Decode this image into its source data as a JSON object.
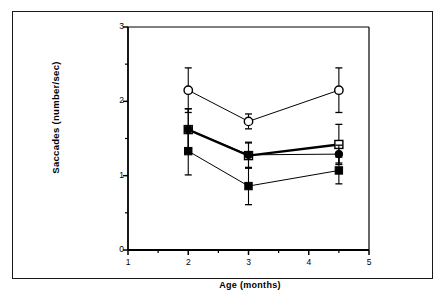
{
  "figure": {
    "background_color": "#ffffff",
    "frame_color": "#1a1a1a",
    "line_color": "#000000"
  },
  "axes": {
    "x_label": "Age (months)",
    "y_label": "Saccades   (number/sec)",
    "x_ticks": [
      "1",
      "2",
      "3",
      "4",
      "5"
    ],
    "y_ticks": [
      "0",
      "1",
      "2",
      "3"
    ]
  },
  "chart_data": {
    "type": "line",
    "title": "",
    "xlabel": "Age (months)",
    "ylabel": "Saccades (number/sec)",
    "xlim": [
      1,
      5
    ],
    "ylim": [
      0,
      3
    ],
    "x_ticks": [
      1,
      2,
      3,
      4,
      5
    ],
    "y_ticks": [
      0,
      1,
      2,
      3
    ],
    "x_minor_ticks": [
      1.5,
      2.5,
      3.5,
      4.5
    ],
    "y_minor_ticks": [
      0.5,
      1.5,
      2.5
    ],
    "grid": false,
    "legend": "none",
    "error_bars": "symmetric",
    "x": [
      2,
      3,
      4.5
    ],
    "series": [
      {
        "name": "open-circle",
        "marker": "open-circle",
        "line_width": 1,
        "values": [
          2.15,
          1.73,
          2.15
        ],
        "errors": [
          0.3,
          0.1,
          0.3
        ]
      },
      {
        "name": "open-square",
        "marker": "open-square",
        "line_width": 2.4,
        "values": [
          1.62,
          1.27,
          1.42
        ],
        "errors": [
          0.28,
          0.17,
          0.27
        ]
      },
      {
        "name": "filled-circle",
        "marker": "filled-circle",
        "line_width": 1,
        "values": [
          1.62,
          1.28,
          1.29
        ],
        "errors": [
          0.28,
          0.17,
          0.12
        ]
      },
      {
        "name": "filled-square",
        "marker": "filled-square",
        "line_width": 1,
        "values": [
          1.33,
          0.86,
          1.07
        ],
        "errors": [
          0.32,
          0.25,
          0.18
        ]
      }
    ]
  }
}
